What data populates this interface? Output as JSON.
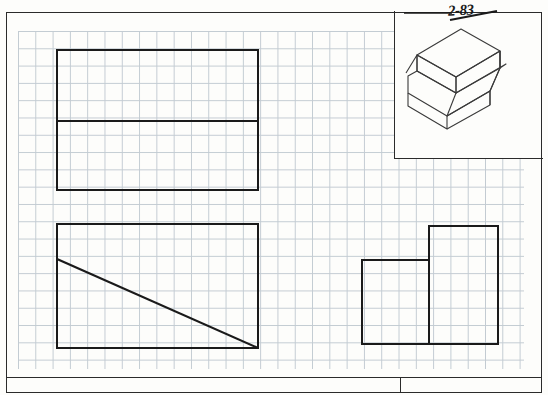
{
  "sheet": {
    "title": "Orthographic projection worksheet",
    "paper": "engineering grid paper",
    "grid_square_px": 17.3,
    "border_color": "#2b2b2b",
    "grid_color": "#b9c3cc",
    "line_color": "#1a1a1a"
  },
  "annotations": {
    "revision_label": "2-83",
    "revision_underline": true
  },
  "views": {
    "top_view": {
      "name": "Top view",
      "label": "",
      "outline": [
        [
          57,
          50
        ],
        [
          258,
          50
        ],
        [
          258,
          190
        ],
        [
          57,
          190
        ]
      ],
      "internal_lines": [
        [
          [
            57,
            121
          ],
          [
            258,
            121
          ]
        ]
      ]
    },
    "front_view": {
      "name": "Front view",
      "label": "",
      "outline": [
        [
          57,
          224
        ],
        [
          258,
          224
        ],
        [
          258,
          348
        ],
        [
          57,
          348
        ]
      ],
      "internal_lines": [
        [
          [
            57,
            259
          ],
          [
            258,
            348
          ]
        ]
      ]
    },
    "side_view": {
      "name": "Right side view",
      "label": "",
      "outline": [
        [
          362,
          260
        ],
        [
          429,
          260
        ],
        [
          429,
          226
        ],
        [
          498,
          226
        ],
        [
          498,
          344
        ],
        [
          362,
          344
        ]
      ],
      "internal_lines": [
        [
          [
            429,
            260
          ],
          [
            429,
            344
          ]
        ]
      ]
    },
    "pictorial": {
      "name": "Isometric pictorial",
      "label": "",
      "description": "stepped block with chamfered face"
    }
  },
  "title_block": {
    "left_cell": "",
    "right_cell": "",
    "divider_x": 400
  }
}
